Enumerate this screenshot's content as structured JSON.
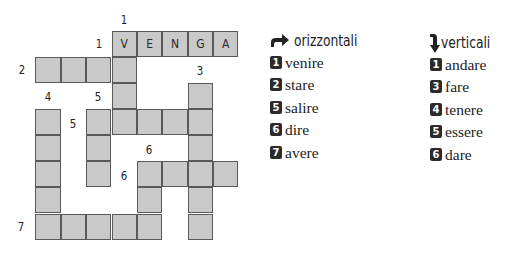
{
  "crossword": {
    "solved_row_1": [
      "V",
      "E",
      "N",
      "G",
      "A"
    ],
    "clue_numbers": {
      "down_1": "1",
      "across_1": "1",
      "across_2": "2",
      "down_3": "3",
      "down_4": "4",
      "down_5": "5",
      "across_5": "5",
      "down_6": "6",
      "across_6": "6",
      "across_7": "7"
    }
  },
  "legend": {
    "across": {
      "icon": "arrow-right-curved-icon",
      "title": "orizzontali",
      "items": [
        {
          "num": "1",
          "word": "venire"
        },
        {
          "num": "2",
          "word": "stare"
        },
        {
          "num": "5",
          "word": "salire"
        },
        {
          "num": "6",
          "word": "dire"
        },
        {
          "num": "7",
          "word": "avere"
        }
      ]
    },
    "down": {
      "icon": "arrow-down-curved-icon",
      "title": "verticali",
      "items": [
        {
          "num": "1",
          "word": "andare"
        },
        {
          "num": "3",
          "word": "fare"
        },
        {
          "num": "4",
          "word": "tenere"
        },
        {
          "num": "5",
          "word": "essere"
        },
        {
          "num": "6",
          "word": "dare"
        }
      ]
    }
  },
  "colors": {
    "cell_fill": "#c9c9c9",
    "cell_border": "#595959",
    "badge": "#2b2b2b"
  }
}
